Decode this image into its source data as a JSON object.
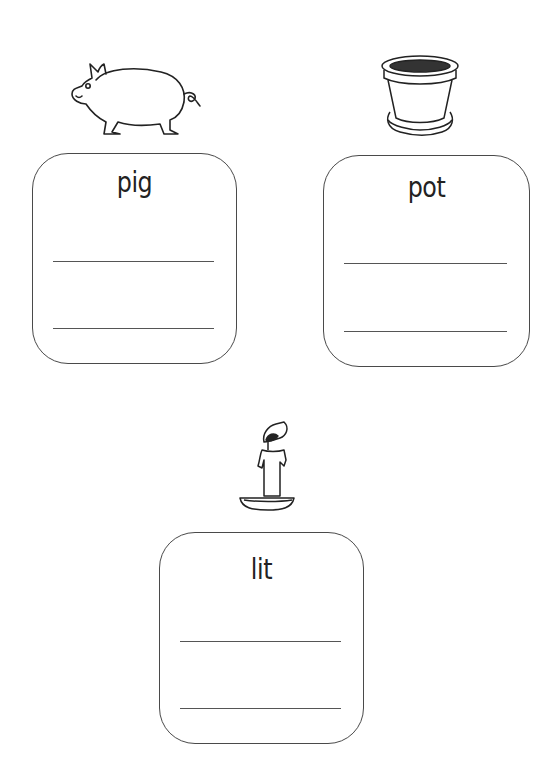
{
  "worksheet": {
    "items": [
      {
        "word": "pig",
        "picture": "pig-picture"
      },
      {
        "word": "pot",
        "picture": "flower-pot-picture"
      },
      {
        "word": "lit",
        "picture": "lit-candle-picture"
      }
    ]
  }
}
